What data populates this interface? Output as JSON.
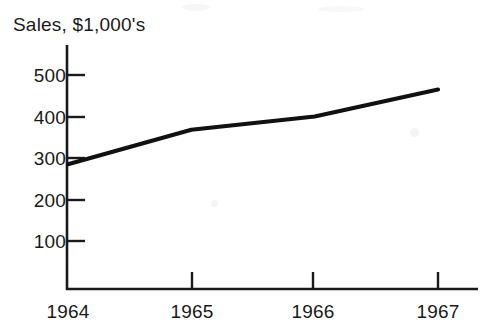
{
  "chart_data": {
    "type": "line",
    "title": "Sales, $1,000's",
    "xlabel": "",
    "ylabel": "",
    "categories": [
      "1964",
      "1965",
      "1966",
      "1967"
    ],
    "series": [
      {
        "name": "Sales",
        "values": [
          285,
          368,
          400,
          465
        ]
      }
    ],
    "x": [
      1964,
      1965,
      1966,
      1967
    ],
    "xlim": [
      1964,
      1967
    ],
    "ylim": [
      0,
      540
    ],
    "yticks": [
      100,
      200,
      300,
      400,
      500
    ],
    "ytick_labels": [
      "500",
      "400",
      "300",
      "200",
      "100"
    ],
    "xtick_labels": [
      "1964",
      "1965",
      "1966",
      "1967"
    ],
    "grid": false,
    "legend": false,
    "line_color": "#111111",
    "axis_color": "#1a1a1a",
    "background_color": "#ffffff"
  },
  "axes": {
    "y_labels": [
      "500",
      "400",
      "300",
      "200",
      "100"
    ],
    "x_labels": [
      "1964",
      "1965",
      "1966",
      "1967"
    ]
  }
}
